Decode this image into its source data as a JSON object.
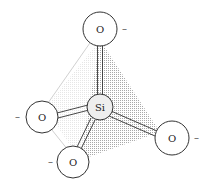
{
  "diagram": {
    "central_atom": {
      "label": "Si",
      "x": 100,
      "y": 107,
      "r": 13
    },
    "oxygens": [
      {
        "id": "top",
        "label": "O",
        "charge": "–",
        "x": 100,
        "y": 29,
        "r": 17,
        "charge_x": 122,
        "charge_y": 32
      },
      {
        "id": "left",
        "label": "O",
        "charge": "–",
        "x": 42,
        "y": 117,
        "r": 16,
        "charge_x": 15,
        "charge_y": 120
      },
      {
        "id": "bottom",
        "label": "O",
        "charge": "–",
        "x": 73,
        "y": 162,
        "r": 16,
        "charge_x": 48,
        "charge_y": 165
      },
      {
        "id": "right",
        "label": "O",
        "charge": "–",
        "x": 172,
        "y": 138,
        "r": 17,
        "charge_x": 194,
        "charge_y": 141
      }
    ],
    "colors": {
      "stroke": "#333333",
      "shade": "#bdbdbd",
      "atom_fill": "#ffffff",
      "si_fill": "#eeeeee"
    }
  }
}
